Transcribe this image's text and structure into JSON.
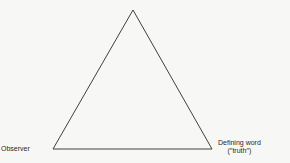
{
  "diagram": {
    "shape": "triangle",
    "vertices": {
      "apex": {
        "label": ""
      },
      "left": {
        "label": "Observer"
      },
      "right": {
        "label_line1": "Defining word",
        "label_line2": "(′′truth′′)"
      }
    },
    "colors": {
      "background": "#f7f7f5",
      "line": "#2a2a2a",
      "text": "#2a2a2a"
    }
  }
}
